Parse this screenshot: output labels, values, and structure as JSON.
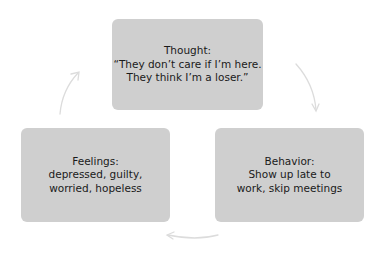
{
  "diagram": {
    "type": "cycle",
    "colors": {
      "box_fill": "#cfcfcf",
      "text": "#1a1a1a",
      "arrow": "#dcdcdc",
      "background": "#ffffff"
    },
    "nodes": [
      {
        "id": "thought",
        "title": "Thought:",
        "lines": [
          "“They don’t care if I’m here.",
          "They think I’m a loser.”"
        ]
      },
      {
        "id": "behavior",
        "title": "Behavior:",
        "lines": [
          "Show up late to",
          "work, skip meetings"
        ]
      },
      {
        "id": "feelings",
        "title": "Feelings:",
        "lines": [
          "depressed, guilty,",
          "worried, hopeless"
        ]
      }
    ],
    "edges": [
      {
        "from": "thought",
        "to": "behavior",
        "icon": "curved-arrow-down-right"
      },
      {
        "from": "behavior",
        "to": "feelings",
        "icon": "curved-arrow-left"
      },
      {
        "from": "feelings",
        "to": "thought",
        "icon": "curved-arrow-up-right"
      }
    ]
  }
}
